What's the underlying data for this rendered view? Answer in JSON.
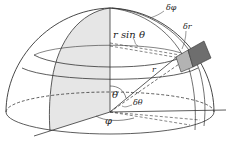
{
  "diagram": {
    "type": "spherical-coordinates-hemisphere",
    "labels": {
      "delta_phi": "δφ",
      "r_sin_theta": "r sin θ",
      "delta_r": "δr",
      "r": "r",
      "theta": "θ",
      "delta_theta": "δθ",
      "phi": "φ"
    },
    "colors": {
      "line": "#333333",
      "meridian_fill": "#e6e6e6",
      "volume_front": "#b3b3b3",
      "volume_side": "#6e6e6e",
      "background": "#ffffff"
    }
  }
}
